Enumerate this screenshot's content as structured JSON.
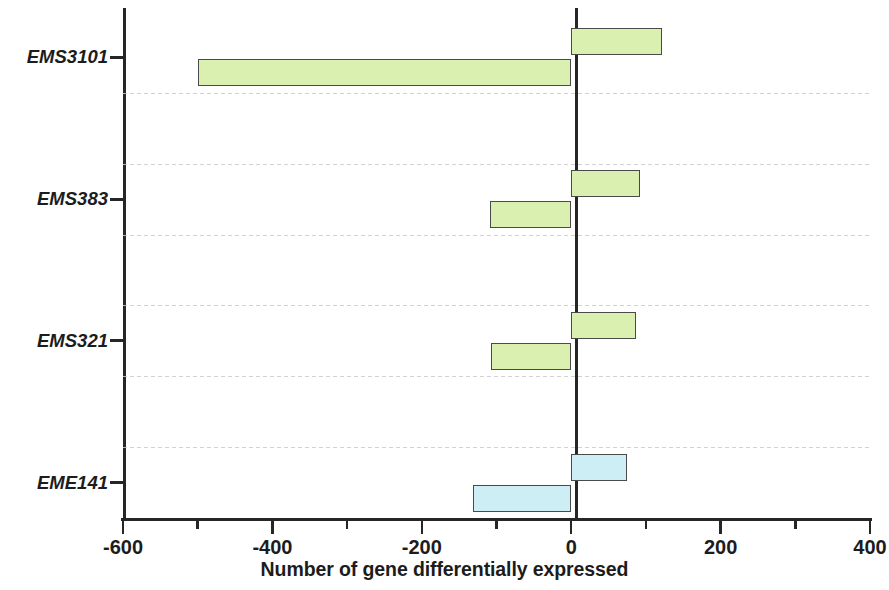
{
  "chart_data": {
    "type": "bar",
    "orientation": "horizontal",
    "title": "",
    "xlabel": "Number of gene differentially expressed",
    "ylabel": "",
    "xlim": [
      -600,
      400
    ],
    "ylim": null,
    "grid": "horizontal dotted separators between categories",
    "legend": null,
    "legend_position": "none",
    "x_major_ticks": [
      -600,
      -400,
      -200,
      0,
      200,
      400
    ],
    "x_tick_labels": [
      "-600",
      "-400",
      "-200",
      "0",
      "200",
      "400"
    ],
    "x_minor_ticks": [
      -500,
      -300,
      -100,
      100,
      300
    ],
    "categories": [
      "EMS3101",
      "EMS383",
      "EMS321",
      "EME141",
      "EME126",
      "EME394",
      "EME343"
    ],
    "series": [
      {
        "name": "Up-regulated",
        "values": [
          122,
          92,
          87,
          75,
          60,
          113,
          227
        ]
      },
      {
        "name": "Down-regulated",
        "values": [
          -500,
          -109,
          -107,
          -132,
          -91,
          -92,
          -79
        ]
      }
    ],
    "bars": [
      {
        "category": "EMS3101",
        "up": 122,
        "down": -500,
        "color": "#d9f0b1"
      },
      {
        "category": "EMS383",
        "up": 92,
        "down": -109,
        "color": "#d9f0b1"
      },
      {
        "category": "EMS321",
        "up": 87,
        "down": -107,
        "color": "#d9f0b1"
      },
      {
        "category": "EME141",
        "up": 75,
        "down": -132,
        "color": "#cdeef5"
      },
      {
        "category": "EME126",
        "up": 60,
        "down": -91,
        "color": "#cdeef5"
      },
      {
        "category": "EME394",
        "up": 113,
        "down": -92,
        "color": "#cdeef5"
      },
      {
        "category": "EME343",
        "up": 227,
        "down": -79,
        "color": "#cdeef5"
      }
    ],
    "colors": {
      "green_group": "#d9f0b1",
      "blue_group": "#cdeef5",
      "bar_outline": "#4a4a4a",
      "axis": "#262626",
      "gridline": "#c9c9c9"
    }
  }
}
